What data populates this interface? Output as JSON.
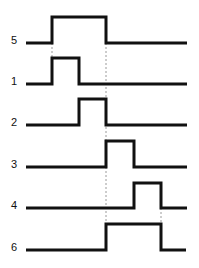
{
  "diagram": {
    "background_color": "#ffffff",
    "line_color": "#111111",
    "guide_color": "#9a9a9a",
    "width": 199,
    "height": 268,
    "line_width": 3,
    "x_start": 26,
    "x_end": 187
  },
  "chart_data": {
    "type": "line",
    "subtype": "digital-timing-waveform",
    "xlabel": "",
    "ylabel": "",
    "grid": false,
    "legend": "none",
    "x_transition_ticks": [
      52,
      79,
      106,
      134,
      161
    ],
    "x_range": [
      26,
      187
    ],
    "levels": {
      "low": 0,
      "high": 1
    },
    "series": [
      {
        "name": "5",
        "label": "5",
        "order": 1,
        "label_x": 14,
        "baseline_y": 43,
        "high_y": 17,
        "rise_x": 52,
        "fall_x": 106,
        "values": [
          0,
          1,
          1,
          0,
          0,
          0
        ],
        "points": [
          [
            26,
            0
          ],
          [
            52,
            0
          ],
          [
            52,
            1
          ],
          [
            106,
            1
          ],
          [
            106,
            0
          ],
          [
            187,
            0
          ]
        ]
      },
      {
        "name": "1",
        "label": "1",
        "order": 2,
        "label_x": 14,
        "baseline_y": 84,
        "high_y": 58,
        "rise_x": 52,
        "fall_x": 79,
        "values": [
          0,
          1,
          0,
          0,
          0,
          0
        ],
        "points": [
          [
            26,
            0
          ],
          [
            52,
            0
          ],
          [
            52,
            1
          ],
          [
            79,
            1
          ],
          [
            79,
            0
          ],
          [
            187,
            0
          ]
        ]
      },
      {
        "name": "2",
        "label": "2",
        "order": 3,
        "label_x": 14,
        "baseline_y": 125,
        "high_y": 99,
        "rise_x": 79,
        "fall_x": 106,
        "values": [
          0,
          0,
          1,
          0,
          0,
          0
        ],
        "points": [
          [
            26,
            0
          ],
          [
            79,
            0
          ],
          [
            79,
            1
          ],
          [
            106,
            1
          ],
          [
            106,
            0
          ],
          [
            187,
            0
          ]
        ]
      },
      {
        "name": "3",
        "label": "3",
        "order": 4,
        "label_x": 14,
        "baseline_y": 167,
        "high_y": 141,
        "rise_x": 106,
        "fall_x": 134,
        "values": [
          0,
          0,
          0,
          1,
          0,
          0
        ],
        "points": [
          [
            26,
            0
          ],
          [
            106,
            0
          ],
          [
            106,
            1
          ],
          [
            134,
            1
          ],
          [
            134,
            0
          ],
          [
            187,
            0
          ]
        ]
      },
      {
        "name": "4",
        "label": "4",
        "order": 5,
        "label_x": 14,
        "baseline_y": 208,
        "high_y": 183,
        "rise_x": 134,
        "fall_x": 161,
        "values": [
          0,
          0,
          0,
          0,
          1,
          0
        ],
        "points": [
          [
            26,
            0
          ],
          [
            134,
            0
          ],
          [
            134,
            1
          ],
          [
            161,
            1
          ],
          [
            161,
            0
          ],
          [
            187,
            0
          ]
        ]
      },
      {
        "name": "6",
        "label": "6",
        "order": 6,
        "label_x": 14,
        "baseline_y": 250,
        "high_y": 224,
        "rise_x": 106,
        "fall_x": 161,
        "values": [
          0,
          0,
          0,
          1,
          1,
          0
        ],
        "points": [
          [
            26,
            0
          ],
          [
            106,
            0
          ],
          [
            106,
            1
          ],
          [
            161,
            1
          ],
          [
            161,
            0
          ],
          [
            186,
            0
          ]
        ]
      }
    ],
    "guides": [
      {
        "name": "guide-a",
        "x": 52,
        "y1": 43,
        "y2": 58
      },
      {
        "name": "guide-b",
        "x": 106,
        "y1": 43,
        "y2": 224
      },
      {
        "name": "guide-c",
        "x": 161,
        "y1": 208,
        "y2": 224
      }
    ]
  }
}
